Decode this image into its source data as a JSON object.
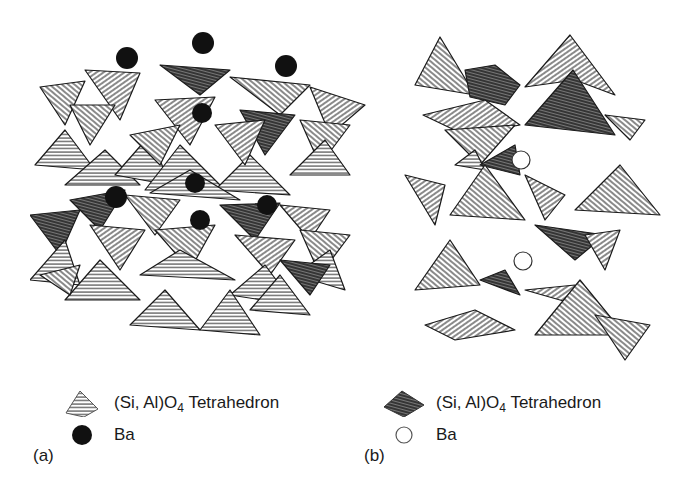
{
  "figure": {
    "panel_a": {
      "label": "(a)",
      "legend": [
        {
          "symbol": "tetrahedron-light",
          "text_pre": "(Si, Al)O",
          "subscript": "4",
          "text_post": " Tetrahedron"
        },
        {
          "symbol": "filled-circle",
          "text_pre": "Ba",
          "subscript": "",
          "text_post": ""
        }
      ],
      "ba_style": "filled",
      "ba_color": "#111111"
    },
    "panel_b": {
      "label": "(b)",
      "legend": [
        {
          "symbol": "tetrahedron-dark",
          "text_pre": "(Si, Al)O",
          "subscript": "4",
          "text_post": " Tetrahedron"
        },
        {
          "symbol": "open-circle",
          "text_pre": "Ba",
          "subscript": "",
          "text_post": ""
        }
      ],
      "ba_style": "open",
      "ba_color": "#ffffff"
    },
    "colors": {
      "ink": "#1a1a1a",
      "hatch": "#333333",
      "background": "#ffffff"
    }
  }
}
